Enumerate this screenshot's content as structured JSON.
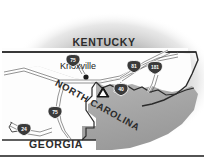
{
  "figure": {
    "name": "regional-locator-map",
    "width": 204,
    "height": 161,
    "background_color": "#ffffff",
    "halo_color": "#b9b9b9",
    "land_fill_color": "#fdfdfd",
    "nc_fill_color": "#a8a8a8",
    "border_line_color": "#2b2b2b",
    "road_line_color": "#4a4a4a",
    "shield_fill_color": "#3a3a3a",
    "shield_text_color": "#ffffff"
  },
  "state_labels": [
    {
      "id": "kentucky",
      "text": "KENTUCKY",
      "x": 104,
      "y": 46,
      "size": 10.5,
      "rotate": 0
    },
    {
      "id": "north-carolina",
      "text": "NORTH CAROLINA",
      "x": 96,
      "y": 108,
      "size": 9.5,
      "rotate": 29
    },
    {
      "id": "georgia",
      "text": "GEORGIA",
      "x": 56,
      "y": 148,
      "size": 10.5,
      "rotate": 0
    }
  ],
  "cities": [
    {
      "id": "knoxville",
      "name": "Knoxville",
      "label_x": 60,
      "label_y": 69,
      "dot_x": 86,
      "dot_y": 77,
      "size": 9
    }
  ],
  "landmarks": [
    {
      "id": "mountain-peak",
      "symbol": "mountain-marker",
      "x": 103,
      "y": 94
    }
  ],
  "highway_shields": [
    {
      "id": "i-75-north",
      "number": "75",
      "x": 73,
      "y": 61
    },
    {
      "id": "i-81",
      "number": "81",
      "x": 134,
      "y": 67
    },
    {
      "id": "i-181",
      "number": "181",
      "x": 155,
      "y": 68
    },
    {
      "id": "i-40",
      "number": "40",
      "x": 121,
      "y": 90
    },
    {
      "id": "i-75-south",
      "number": "75",
      "x": 55,
      "y": 113
    },
    {
      "id": "i-24",
      "number": "24",
      "x": 24,
      "y": 130
    }
  ],
  "frame": {
    "bottom_rule_y": 156,
    "bottom_rule_color": "#1a1a1a"
  }
}
